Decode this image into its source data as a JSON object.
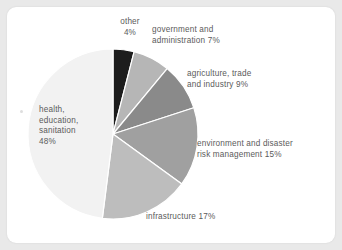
{
  "card": {
    "background_color": "#ffffff",
    "page_background_color": "#e9e9e9"
  },
  "chart_data": {
    "type": "pie",
    "title": "",
    "subtitle": "",
    "xlabel": "",
    "ylabel": "",
    "legend_position": "none",
    "grid": false,
    "units": "percent",
    "start_angle_deg": 0,
    "direction": "clockwise",
    "categories": [
      "other",
      "government and administration",
      "agriculture, trade and industry",
      "environment and disaster risk management",
      "infrastructure",
      "health, education, sanitation"
    ],
    "values": [
      4,
      7,
      9,
      15,
      17,
      48
    ],
    "colors": [
      "#1d1d1d",
      "#b6b6b6",
      "#8a8a8a",
      "#a0a0a0",
      "#bdbdbd",
      "#f2f2f2"
    ],
    "slice_separator_color": "#ffffff",
    "labels": [
      {
        "text": "other\n4%",
        "value": 4,
        "color": "#1d1d1d"
      },
      {
        "text": "government and\nadministration 7%",
        "value": 7,
        "color": "#b6b6b6"
      },
      {
        "text": "agriculture, trade\nand industry 9%",
        "value": 9,
        "color": "#8a8a8a"
      },
      {
        "text": "environment and disaster\nrisk management 15%",
        "value": 15,
        "color": "#a0a0a0"
      },
      {
        "text": "infrastructure 17%",
        "value": 17,
        "color": "#bdbdbd"
      },
      {
        "text": "health,\neducation,\nsanitation\n48%",
        "value": 48,
        "color": "#f2f2f2"
      }
    ]
  },
  "annotations": {
    "label_text_color": "#5b5b5b"
  }
}
